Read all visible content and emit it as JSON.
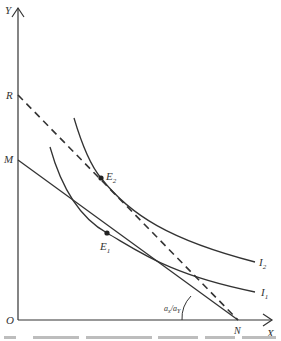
{
  "diagram": {
    "type": "indifference-curve-budget-diagram",
    "axes": {
      "y_label": "Y",
      "x_label": "X",
      "origin_label": "O"
    },
    "points": {
      "R": {
        "label": "R",
        "x": 18,
        "y": 95
      },
      "M": {
        "label": "M",
        "x": 18,
        "y": 160
      },
      "N": {
        "label": "N",
        "x": 238,
        "y": 320
      },
      "E1": {
        "label": "E",
        "sub": "1",
        "x": 107,
        "y": 233
      },
      "E2": {
        "label": "E",
        "sub": "2",
        "x": 101,
        "y": 178
      }
    },
    "curves": [
      {
        "name": "I1",
        "label": "I",
        "sub": "1"
      },
      {
        "name": "I2",
        "label": "I",
        "sub": "2"
      }
    ],
    "lines": [
      {
        "name": "budget-line-MN",
        "style": "solid",
        "from": "M",
        "to": "N"
      },
      {
        "name": "price-line-RN",
        "style": "dashed",
        "from": "R",
        "to": "N"
      }
    ],
    "angle_label": {
      "num": "a",
      "num_sub": "x",
      "den": "a",
      "den_sub": "Y"
    }
  },
  "caption": {
    "visible": "clipped (illegible)"
  },
  "colors": {
    "line": "#333333",
    "background": "#ffffff"
  }
}
